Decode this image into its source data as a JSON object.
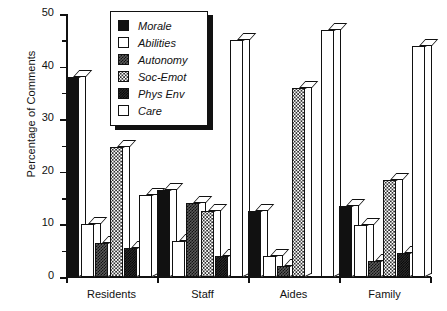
{
  "chart_data": {
    "type": "bar",
    "title": "",
    "xlabel": "",
    "ylabel": "Percentage of Comments",
    "ylim": [
      0,
      50
    ],
    "yticks": [
      0,
      10,
      20,
      30,
      40,
      50
    ],
    "yticks_minor": [
      5,
      15,
      25,
      35,
      45
    ],
    "grid": false,
    "legend_position": "top-left-inside",
    "categories": [
      "Residents",
      "Staff",
      "Aides",
      "Family"
    ],
    "series": [
      {
        "name": "Morale",
        "values": [
          38.0,
          16.5,
          12.5,
          13.5
        ]
      },
      {
        "name": "Abilities",
        "values": [
          10.0,
          6.8,
          4.0,
          9.8
        ]
      },
      {
        "name": "Autonomy",
        "values": [
          6.5,
          14.0,
          2.0,
          3.0
        ]
      },
      {
        "name": "Soc-Emot",
        "values": [
          24.7,
          12.5,
          36.0,
          18.5
        ]
      },
      {
        "name": "Phys Env",
        "values": [
          5.5,
          4.0,
          0.0,
          4.5
        ]
      },
      {
        "name": "Care",
        "values": [
          15.5,
          45.0,
          47.0,
          44.0
        ]
      }
    ]
  },
  "legend": {
    "items": [
      {
        "label": "Morale",
        "pattern": "p-morale"
      },
      {
        "label": "Abilities",
        "pattern": "p-abilities"
      },
      {
        "label": "Autonomy",
        "pattern": "p-autonomy"
      },
      {
        "label": "Soc-Emot",
        "pattern": "p-socemot"
      },
      {
        "label": "Phys Env",
        "pattern": "p-physenv"
      },
      {
        "label": "Care",
        "pattern": "p-care"
      }
    ]
  },
  "caption": "",
  "colors": {
    "ink": "#111111",
    "paper": "#ffffff"
  }
}
